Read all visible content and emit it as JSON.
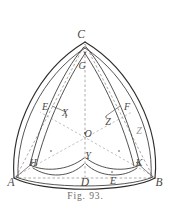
{
  "figure": {
    "caption": "Fig. 93.",
    "background_color": "#ffffff",
    "ink_color": "#2f2d2b",
    "dashed_color": "#8b8783",
    "faint_color": "#9c9894",
    "width": 171,
    "height": 217
  },
  "labels": {
    "A": "A",
    "B": "B",
    "C": "C",
    "D": "D",
    "E": "E",
    "E2": "E",
    "F": "F",
    "G": "G",
    "H": "H",
    "K": "K",
    "O": "O",
    "X": "X",
    "Y": "Y",
    "Z": "Z",
    "Z2": "Z"
  },
  "points": [
    {
      "name": "A",
      "label": "A",
      "x": 14,
      "y": 178,
      "role": "outer-vertex"
    },
    {
      "name": "B",
      "label": "B",
      "x": 155,
      "y": 178,
      "role": "outer-vertex"
    },
    {
      "name": "C",
      "label": "C",
      "x": 85,
      "y": 42,
      "role": "outer-vertex"
    },
    {
      "name": "D",
      "label": "D",
      "x": 85,
      "y": 178,
      "role": "edge-midpoint"
    },
    {
      "name": "E",
      "label": "E",
      "x": 48,
      "y": 108,
      "role": "edge-midpoint"
    },
    {
      "name": "F",
      "label": "F",
      "x": 123,
      "y": 108,
      "role": "edge-midpoint"
    },
    {
      "name": "G",
      "label": "G",
      "x": 85,
      "y": 65,
      "role": "inner-arc-apex"
    },
    {
      "name": "O",
      "label": "O",
      "x": 85,
      "y": 133,
      "role": "center"
    },
    {
      "name": "X",
      "label": "X",
      "x": 64,
      "y": 114,
      "role": "inner-node"
    },
    {
      "name": "Y",
      "label": "Y",
      "x": 85,
      "y": 160,
      "role": "inner-node"
    },
    {
      "name": "Z",
      "label": "Z",
      "x": 108,
      "y": 120,
      "role": "inner-node"
    },
    {
      "name": "H",
      "label": "H",
      "x": 32,
      "y": 163,
      "role": "inner-node"
    },
    {
      "name": "K",
      "label": "K",
      "x": 137,
      "y": 163,
      "role": "inner-node"
    },
    {
      "name": "E2",
      "label": "E",
      "x": 110,
      "y": 176,
      "role": "edge-node"
    },
    {
      "name": "Z2",
      "label": "Z",
      "x": 138,
      "y": 131,
      "role": "edge-node-faint"
    }
  ],
  "curves": [
    {
      "name": "outer-arc-A-C",
      "type": "circular-arc",
      "from": "A",
      "to": "C"
    },
    {
      "name": "outer-arc-C-B",
      "type": "circular-arc",
      "from": "C",
      "to": "B"
    },
    {
      "name": "outer-arc-A-B",
      "type": "circular-arc",
      "from": "A",
      "to": "B"
    },
    {
      "name": "inner-arc-A-C",
      "type": "circular-arc",
      "from": "A",
      "to": "C"
    },
    {
      "name": "inner-arc-C-B",
      "type": "circular-arc",
      "from": "C",
      "to": "B"
    },
    {
      "name": "inner-arc-A-B",
      "type": "circular-arc",
      "from": "A",
      "to": "B"
    },
    {
      "name": "petal-arc-left",
      "type": "circular-arc",
      "from": "G",
      "to": "H"
    },
    {
      "name": "petal-arc-right",
      "type": "circular-arc",
      "from": "G",
      "to": "K"
    },
    {
      "name": "petal-arc-bottom",
      "type": "circular-arc",
      "from": "H",
      "to": "K"
    }
  ],
  "construction_lines": [
    {
      "name": "median-C-D",
      "type": "dashed",
      "from": "C",
      "to": "D"
    },
    {
      "name": "median-A-F",
      "type": "dashed",
      "from": "A",
      "to": "F"
    },
    {
      "name": "median-B-E",
      "type": "dashed",
      "from": "B",
      "to": "E"
    },
    {
      "name": "chord-A-B",
      "type": "dashed",
      "from": "A",
      "to": "B"
    },
    {
      "name": "chord-A-C",
      "type": "dashed",
      "from": "A",
      "to": "C"
    },
    {
      "name": "chord-C-B",
      "type": "dashed",
      "from": "C",
      "to": "B"
    }
  ]
}
